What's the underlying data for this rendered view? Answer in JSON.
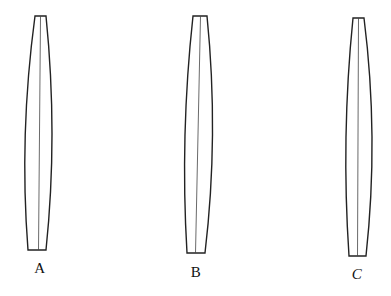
{
  "figure": {
    "stroke_color": "#222222",
    "background": "#ffffff",
    "shapes": [
      {
        "id": "A",
        "label": "A",
        "top": {
          "y": 16,
          "x_left": 35,
          "x_right": 46
        },
        "bottom": {
          "y": 250,
          "x_left": 28,
          "x_right": 46
        },
        "bulge": {
          "y": 140,
          "x_left": 23,
          "x_right": 54
        },
        "center_line": {
          "x_top": 40.5,
          "x_bottom": 38.5
        },
        "label_pos": {
          "x": 40,
          "y": 262
        }
      },
      {
        "id": "B",
        "label": "B",
        "top": {
          "y": 16,
          "x_left": 193,
          "x_right": 207
        },
        "bottom": {
          "y": 253,
          "x_left": 187,
          "x_right": 205
        },
        "bulge": {
          "y": 140,
          "x_left": 184,
          "x_right": 214
        },
        "center_line": {
          "x_top": 200.5,
          "x_bottom": 195.5
        },
        "label_pos": {
          "x": 196,
          "y": 266
        }
      },
      {
        "id": "C",
        "label": "C",
        "top": {
          "y": 18,
          "x_left": 353,
          "x_right": 364
        },
        "bottom": {
          "y": 256,
          "x_left": 349,
          "x_right": 366
        },
        "bulge": {
          "y": 140,
          "x_left": 345,
          "x_right": 374
        },
        "center_line": {
          "x_top": 358.5,
          "x_bottom": 357.5
        },
        "label_pos": {
          "x": 357,
          "y": 268
        }
      }
    ]
  }
}
